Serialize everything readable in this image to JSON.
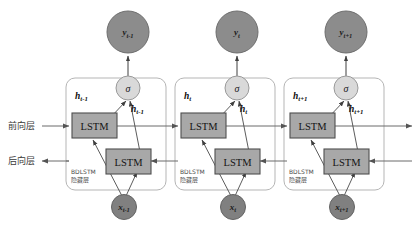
{
  "figure": {
    "type": "bdlstm-architecture-diagram",
    "background_color": "#ffffff"
  },
  "colors": {
    "output_node_fill": "#8c8c8c",
    "output_node_stroke": "#6e6e6e",
    "input_node_fill": "#808080",
    "input_node_stroke": "#636363",
    "sigma_node_fill": "#d9d9d9",
    "sigma_node_stroke": "#9a9a9a",
    "lstm_fill": "#a8a8a8",
    "lstm_stroke": "#4f4f4f",
    "container_stroke": "#b5b5b5",
    "arrow_color": "#545454",
    "line_color": "#6b6b6b"
  },
  "side_labels": {
    "forward": "前向层",
    "backward": "后向层"
  },
  "block_caption": {
    "line1": "BDLSTM",
    "line2": "隐藏层"
  },
  "lstm_label": "LSTM",
  "sigma_label": "σ",
  "timesteps": [
    {
      "id": "t-minus-1",
      "output": {
        "base": "y",
        "sub": "t-1"
      },
      "input": {
        "base": "x",
        "sub": "t-1"
      },
      "hidden_left": {
        "base": "h",
        "sub": "t-1"
      },
      "hidden_right": {
        "base": "h",
        "sub": "t-1"
      }
    },
    {
      "id": "t",
      "output": {
        "base": "y",
        "sub": "t"
      },
      "input": {
        "base": "x",
        "sub": "t"
      },
      "hidden_left": {
        "base": "h",
        "sub": "t"
      },
      "hidden_right": {
        "base": "h",
        "sub": "t"
      }
    },
    {
      "id": "t-plus-1",
      "output": {
        "base": "y",
        "sub": "t+1"
      },
      "input": {
        "base": "x",
        "sub": "t+1"
      },
      "hidden_left": {
        "base": "h",
        "sub": "t+1"
      },
      "hidden_right": {
        "base": "h",
        "sub": "t+1"
      }
    }
  ]
}
